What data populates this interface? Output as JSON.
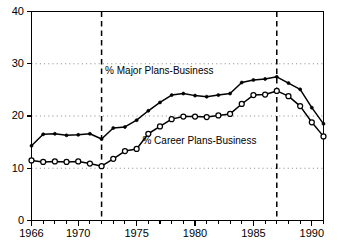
{
  "chart_data": {
    "type": "line",
    "title": "",
    "subtitle": "",
    "xlabel": "",
    "ylabel": "",
    "xlim": [
      1966,
      1991
    ],
    "ylim": [
      0,
      40
    ],
    "grid": "horizontal dotted gridlines at 10, 20, 30",
    "legend_position": "inline annotations on plot",
    "y_ticks": [
      0,
      10,
      20,
      30,
      40
    ],
    "y_tick_labels": [
      "0",
      "10",
      "20",
      "30",
      "40"
    ],
    "x_ticks": [
      1966,
      1967,
      1968,
      1969,
      1970,
      1971,
      1972,
      1973,
      1974,
      1975,
      1976,
      1977,
      1978,
      1979,
      1980,
      1981,
      1982,
      1983,
      1984,
      1985,
      1986,
      1987,
      1988,
      1989,
      1990,
      1991
    ],
    "x_tick_labels_shown": [
      "1966",
      "1970",
      "1975",
      "1980",
      "1985",
      "1990"
    ],
    "x_labeled_years": [
      1966,
      1970,
      1975,
      1980,
      1985,
      1990
    ],
    "x": [
      1966,
      1967,
      1968,
      1969,
      1970,
      1971,
      1972,
      1973,
      1974,
      1975,
      1976,
      1977,
      1978,
      1979,
      1980,
      1981,
      1982,
      1983,
      1984,
      1985,
      1986,
      1987,
      1988,
      1989,
      1990,
      1991
    ],
    "series": [
      {
        "name": "% Major Plans-Business",
        "marker": "filled-dot",
        "values": [
          14.3,
          16.5,
          16.6,
          16.3,
          16.4,
          16.6,
          15.6,
          17.7,
          17.9,
          19.2,
          21.0,
          22.6,
          24.0,
          24.3,
          23.9,
          23.7,
          24.0,
          24.3,
          26.4,
          26.9,
          27.1,
          27.5,
          26.3,
          25.1,
          21.6,
          18.5
        ]
      },
      {
        "name": "% Career Plans-Business",
        "marker": "open-circle",
        "values": [
          11.5,
          11.2,
          11.3,
          11.2,
          11.3,
          10.9,
          10.4,
          11.8,
          13.3,
          13.7,
          16.6,
          18.0,
          19.4,
          19.9,
          19.9,
          19.8,
          20.1,
          20.4,
          22.3,
          24.0,
          24.1,
          24.8,
          23.8,
          21.9,
          18.8,
          16.1
        ]
      }
    ],
    "annotations": [
      {
        "text": "% Major Plans-Business",
        "x": 1972.3,
        "y": 28.6
      },
      {
        "text": "% Career Plans-Business",
        "x": 1975.5,
        "y": 15.2
      }
    ],
    "event_lines": [
      {
        "x": 1972,
        "style": "dashed"
      },
      {
        "x": 1987,
        "style": "dashed"
      }
    ],
    "colors": {
      "line": "#000000",
      "grid": "#7a7a7a",
      "axis": "#000000",
      "background": "#ffffff"
    }
  }
}
